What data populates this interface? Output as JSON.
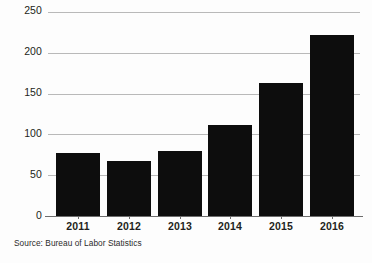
{
  "chart_data": {
    "type": "bar",
    "title": "",
    "subtitle": "",
    "xlabel": "",
    "ylabel": "",
    "categories": [
      "2011",
      "2012",
      "2013",
      "2014",
      "2015",
      "2016"
    ],
    "values": [
      77,
      67,
      80,
      112,
      163,
      222
    ],
    "series": [
      {
        "name": "",
        "values": [
          77,
          67,
          80,
          112,
          163,
          222
        ]
      }
    ],
    "ylim": [
      0,
      250
    ],
    "yticks": [
      0,
      50,
      100,
      150,
      200,
      250
    ],
    "ytick_labels": [
      "0",
      "50",
      "100",
      "150",
      "200",
      "250"
    ],
    "xtick_labels": [
      "2011",
      "2012",
      "2013",
      "2014",
      "2015",
      "2016"
    ],
    "grid": true,
    "grid_axis": "y",
    "legend": false,
    "legend_position": "none",
    "bar_color": "#0d0d0d",
    "gridline_color": "#b9b9b9",
    "axis_color": "#6d6d6d",
    "background_color": "#fdfdfd",
    "annotations": []
  },
  "footnote": {
    "source_text": "Source: Bureau of Labor Statistics"
  }
}
